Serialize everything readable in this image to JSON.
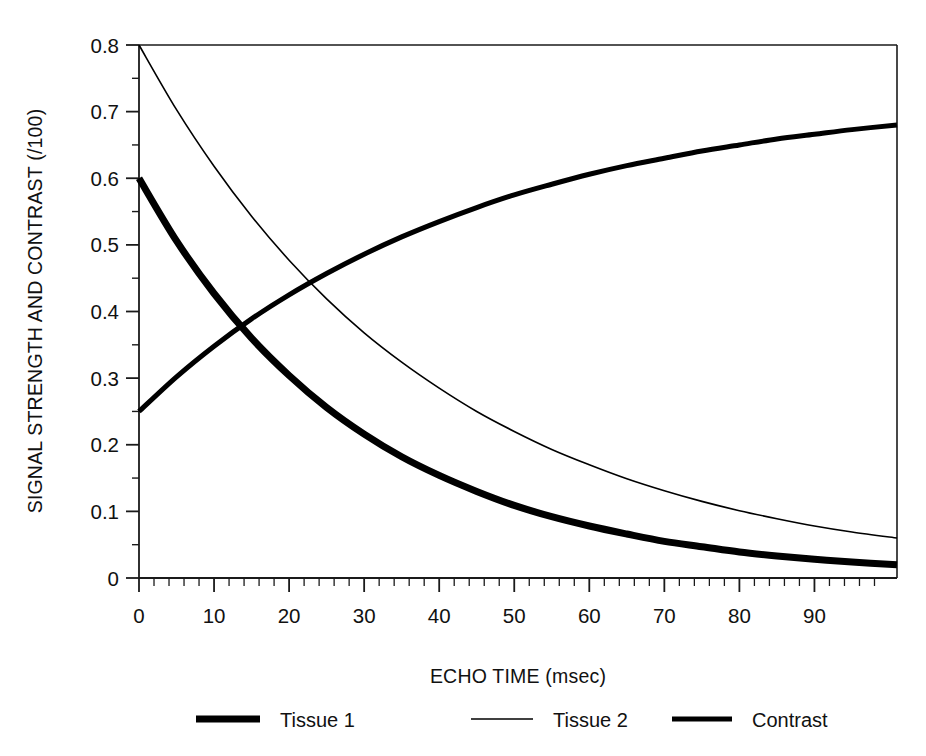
{
  "chart_data": {
    "type": "line",
    "title": "",
    "xlabel": "ECHO TIME (msec)",
    "ylabel": "SIGNAL STRENGTH AND CONTRAST (/100)",
    "xlim": [
      0,
      101
    ],
    "ylim": [
      0,
      0.8
    ],
    "x_ticks": [
      0,
      10,
      20,
      30,
      40,
      50,
      60,
      70,
      80,
      90
    ],
    "x_tick_labels": [
      "0",
      "10",
      "20",
      "30",
      "40",
      "50",
      "60",
      "70",
      "80",
      "90"
    ],
    "x_minor_tick_step": 2,
    "y_ticks": [
      0,
      0.1,
      0.2,
      0.3,
      0.4,
      0.5,
      0.6,
      0.7,
      0.8
    ],
    "y_tick_labels": [
      "0",
      "0.1",
      "0.2",
      "0.3",
      "0.4",
      "0.5",
      "0.6",
      "0.7",
      "0.8"
    ],
    "y_minor_tick_step": 0.05,
    "grid": false,
    "legend_position": "bottom",
    "frame": "top-right-box",
    "x": [
      0,
      5,
      10,
      15,
      20,
      25,
      30,
      35,
      40,
      45,
      50,
      55,
      60,
      65,
      70,
      75,
      80,
      85,
      90,
      95,
      101
    ],
    "series": [
      {
        "name": "Tissue 1",
        "line_width": 7,
        "color": "#000000",
        "values": [
          0.6,
          0.506,
          0.427,
          0.36,
          0.304,
          0.256,
          0.216,
          0.182,
          0.154,
          0.13,
          0.109,
          0.092,
          0.078,
          0.066,
          0.055,
          0.047,
          0.039,
          0.033,
          0.028,
          0.024,
          0.02
        ]
      },
      {
        "name": "Tissue 2",
        "line_width": 1.6,
        "color": "#000000",
        "values": [
          0.8,
          0.703,
          0.618,
          0.543,
          0.477,
          0.419,
          0.368,
          0.324,
          0.285,
          0.25,
          0.22,
          0.193,
          0.17,
          0.149,
          0.131,
          0.115,
          0.101,
          0.089,
          0.078,
          0.069,
          0.06
        ]
      },
      {
        "name": "Contrast",
        "line_width": 5,
        "color": "#000000",
        "values": [
          0.25,
          0.302,
          0.348,
          0.389,
          0.425,
          0.457,
          0.486,
          0.512,
          0.535,
          0.556,
          0.575,
          0.591,
          0.606,
          0.619,
          0.63,
          0.641,
          0.65,
          0.659,
          0.666,
          0.673,
          0.68
        ]
      }
    ],
    "annotations": []
  },
  "legend": {
    "entries": [
      {
        "label": "Tissue 1",
        "swatch": "thick-line-swatch"
      },
      {
        "label": "Tissue 2",
        "swatch": "thin-line-swatch"
      },
      {
        "label": "Contrast",
        "swatch": "medium-line-swatch"
      }
    ]
  },
  "colors": {
    "ink": "#000000",
    "background": "#ffffff",
    "axis": "#1a1a1a"
  }
}
